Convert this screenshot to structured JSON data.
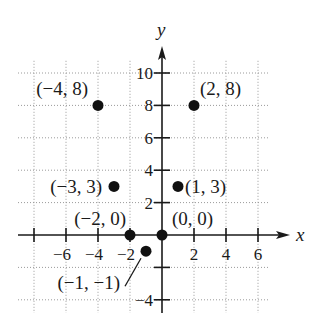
{
  "chart_data": {
    "type": "scatter",
    "title": "",
    "xlabel": "x",
    "ylabel": "y",
    "xlim": [
      -9,
      7
    ],
    "ylim": [
      -5,
      11
    ],
    "grid": true,
    "x_ticks": [
      {
        "value": -6,
        "label": "−6"
      },
      {
        "value": -4,
        "label": "−4"
      },
      {
        "value": -2,
        "label": "−2"
      },
      {
        "value": 2,
        "label": "2"
      },
      {
        "value": 4,
        "label": "4"
      },
      {
        "value": 6,
        "label": "6"
      }
    ],
    "x_unlabeled_ticks": [
      -8
    ],
    "y_ticks": [
      {
        "value": 10,
        "label": "10"
      },
      {
        "value": 8,
        "label": "8"
      },
      {
        "value": 6,
        "label": "6"
      },
      {
        "value": 4,
        "label": "4"
      },
      {
        "value": 2,
        "label": "2"
      },
      {
        "value": -4,
        "label": "−4"
      }
    ],
    "y_unlabeled_ticks": [
      -2
    ],
    "grid_x": [
      -8,
      -6,
      -4,
      -2,
      2,
      4,
      6
    ],
    "grid_y": [
      10,
      8,
      6,
      4,
      2,
      -2,
      -4
    ],
    "points": [
      {
        "x": -4,
        "y": 8,
        "label": "(−4, 8)",
        "label_pos": "upper-left"
      },
      {
        "x": 2,
        "y": 8,
        "label": "(2, 8)",
        "label_pos": "upper-right"
      },
      {
        "x": -3,
        "y": 3,
        "label": "(−3, 3)",
        "label_pos": "left"
      },
      {
        "x": 1,
        "y": 3,
        "label": "(1, 3)",
        "label_pos": "right"
      },
      {
        "x": -2,
        "y": 0,
        "label": "(−2, 0)",
        "label_pos": "above"
      },
      {
        "x": 0,
        "y": 0,
        "label": "(0, 0)",
        "label_pos": "upper-right"
      },
      {
        "x": -1,
        "y": -1,
        "label": "(−1, −1)",
        "label_pos": "lower-left-leader"
      }
    ]
  }
}
